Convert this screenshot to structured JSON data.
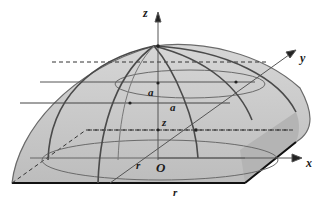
{
  "diagram": {
    "type": "3d-solid-geometry",
    "axes": {
      "x": "x",
      "y": "y",
      "z": "z"
    },
    "labels": {
      "origin": "O",
      "radius_base": "r",
      "radius_front": "r",
      "height": "z",
      "half_side_1": "a",
      "half_side_2": "a"
    },
    "colors": {
      "surface_fill": "#c8c8c8",
      "edge_stroke": "#555555",
      "base_edge": "#111111",
      "dashed": "#333333"
    }
  }
}
